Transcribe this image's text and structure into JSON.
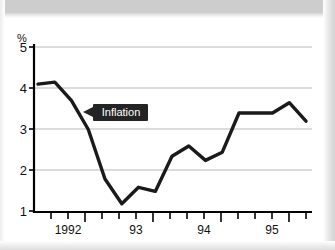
{
  "chart_data": {
    "type": "line",
    "title": "",
    "subtitle": "",
    "xlabel": "",
    "ylabel": "%",
    "ylim": [
      1,
      5
    ],
    "xlim": [
      1991.75,
      1995.75
    ],
    "grid": true,
    "legend_position": "inline-annotation",
    "y_ticks": [
      "5",
      "4",
      "3",
      "2",
      "1"
    ],
    "y_tick_values": [
      5,
      4,
      3,
      2,
      1
    ],
    "x_ticks": [
      "1992",
      "93",
      "94",
      "95"
    ],
    "x_tick_values": [
      1992,
      1993,
      1994,
      1995
    ],
    "x_minor_tick_count": 16,
    "annotations": [
      {
        "text": "Inflation",
        "points_to_series": "Inflation",
        "arrow_direction": "left"
      }
    ],
    "series": [
      {
        "name": "Inflation",
        "color": "#1a1a1a",
        "x": [
          1991.75,
          1992.0,
          1992.25,
          1992.5,
          1992.75,
          1993.0,
          1993.25,
          1993.5,
          1993.75,
          1994.0,
          1994.25,
          1994.5,
          1994.75,
          1995.0,
          1995.25,
          1995.5,
          1995.75
        ],
        "values": [
          4.1,
          4.15,
          3.7,
          3.0,
          1.8,
          1.2,
          1.6,
          1.5,
          2.35,
          2.6,
          2.25,
          2.45,
          3.4,
          3.4,
          3.4,
          3.65,
          3.2
        ]
      }
    ]
  }
}
